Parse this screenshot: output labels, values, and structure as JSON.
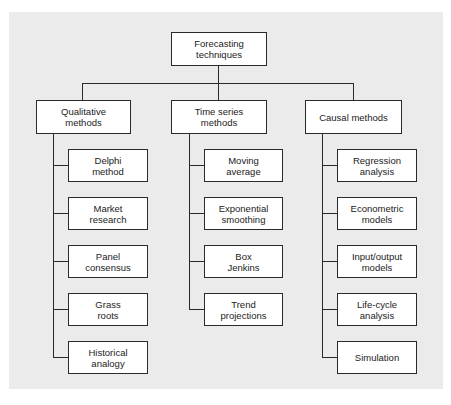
{
  "diagram": {
    "type": "hierarchy",
    "root": {
      "label": "Forecasting\ntechniques"
    },
    "categories": [
      {
        "label": "Qualitative\nmethods",
        "children": [
          {
            "label": "Delphi\nmethod"
          },
          {
            "label": "Market\nresearch"
          },
          {
            "label": "Panel\nconsensus"
          },
          {
            "label": "Grass\nroots"
          },
          {
            "label": "Historical\nanalogy"
          }
        ]
      },
      {
        "label": "Time series\nmethods",
        "children": [
          {
            "label": "Moving\naverage"
          },
          {
            "label": "Exponential\nsmoothing"
          },
          {
            "label": "Box\nJenkins"
          },
          {
            "label": "Trend\nprojections"
          }
        ]
      },
      {
        "label": "Causal methods",
        "children": [
          {
            "label": "Regression\nanalysis"
          },
          {
            "label": "Econometric\nmodels"
          },
          {
            "label": "Input/output\nmodels"
          },
          {
            "label": "Life-cycle\nanalysis"
          },
          {
            "label": "Simulation"
          }
        ]
      }
    ]
  },
  "colors": {
    "background": "#ebebeb",
    "box_fill": "#ffffff",
    "stroke": "#2a2a2a",
    "text": "#222222"
  }
}
